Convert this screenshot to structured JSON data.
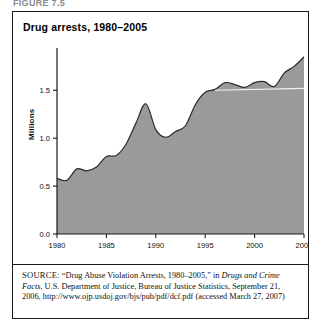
{
  "figure": {
    "label": "FIGURE 7.5",
    "title": "Drug arrests, 1980–2005"
  },
  "source": {
    "prefix": "SOURCE:",
    "line1": "“Drug Abuse Violation Arrests, 1980–2005,” in",
    "italic1": "Drugs and",
    "italic2": "Crime Facts",
    "line2": ", U.S. Department of Justice, Bureau of Justice Statistics,",
    "line3": "September 21, 2006, http://www.ojp.usdoj.gov/bjs/pub/pdf/dcf.pdf",
    "line4": "(accessed March 27, 2007)"
  },
  "chart_data": {
    "type": "area",
    "title": "Drug arrests, 1980–2005",
    "xlabel": "",
    "ylabel": "Millions",
    "xlim": [
      1980,
      2005
    ],
    "ylim": [
      0.0,
      1.9
    ],
    "yticks": [
      0.0,
      0.5,
      1.0,
      1.5
    ],
    "ytick_labels": [
      "0.0",
      "0.5",
      "1.0",
      "1.5"
    ],
    "xticks": [
      1980,
      1985,
      1990,
      1995,
      2000,
      2005
    ],
    "xtick_labels": [
      "1980",
      "1985",
      "1990",
      "1995",
      "2000",
      "2005"
    ],
    "grid": false,
    "legend": null,
    "area_color": "#9a9a9a",
    "line_color": "#2b2b2b",
    "x": [
      1980,
      1981,
      1982,
      1983,
      1984,
      1985,
      1986,
      1987,
      1988,
      1989,
      1990,
      1991,
      1992,
      1993,
      1994,
      1995,
      1996,
      1997,
      1998,
      1999,
      2000,
      2001,
      2002,
      2003,
      2004,
      2005
    ],
    "values": [
      0.58,
      0.56,
      0.68,
      0.66,
      0.7,
      0.81,
      0.82,
      0.94,
      1.16,
      1.36,
      1.09,
      1.01,
      1.07,
      1.13,
      1.35,
      1.48,
      1.51,
      1.58,
      1.56,
      1.53,
      1.58,
      1.59,
      1.54,
      1.68,
      1.75,
      1.85
    ],
    "series_name": "Drug arrests (millions)"
  },
  "axis": {
    "y_label": "Millions"
  }
}
